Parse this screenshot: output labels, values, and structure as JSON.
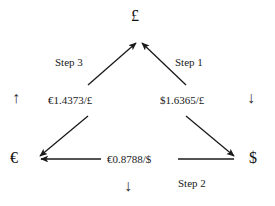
{
  "diagram": {
    "stroke_color": "#1a1a1a",
    "background_color": "#ffffff",
    "nodes": [
      {
        "id": "gbp",
        "label": "£",
        "name": "pound-sterling"
      },
      {
        "id": "eur",
        "label": "€",
        "name": "euro"
      },
      {
        "id": "usd",
        "label": "$",
        "name": "us-dollar"
      }
    ],
    "rates": [
      {
        "id": "eur_per_gbp",
        "label": "€1.4373/£",
        "value": 1.4373,
        "base": "£",
        "quote": "€"
      },
      {
        "id": "usd_per_gbp",
        "label": "$1.6365/£",
        "value": 1.6365,
        "base": "£",
        "quote": "$"
      },
      {
        "id": "eur_per_usd",
        "label": "€0.8788/$",
        "value": 0.8788,
        "base": "$",
        "quote": "€"
      }
    ],
    "steps": [
      {
        "id": "step1",
        "label": "Step 1",
        "order": 1,
        "from": "£",
        "to": "$"
      },
      {
        "id": "step2",
        "label": "Step 2",
        "order": 2,
        "from": "$",
        "to": "€"
      },
      {
        "id": "step3",
        "label": "Step 3",
        "order": 3,
        "from": "€",
        "to": "£"
      }
    ],
    "direction_arrows": [
      {
        "id": "left",
        "glyph": "↑",
        "name": "up-arrow"
      },
      {
        "id": "right",
        "glyph": "↓",
        "name": "down-arrow"
      },
      {
        "id": "bottom",
        "glyph": "↓",
        "name": "down-arrow"
      }
    ]
  }
}
